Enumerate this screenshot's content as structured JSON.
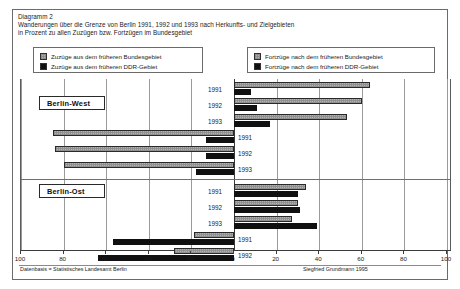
{
  "figure": {
    "label": "Diagramm 2",
    "title_line1": "Wanderungen über die Grenze von Berlin 1991, 1992 und 1993 nach Herkunfts- und Zielgebieten",
    "title_line2": "in Prozent zu allen Zuzügen bzw. Fortzügen im Bundesgebiet",
    "source_left": "Datenbasis = Statistisches Landesamt Berlin",
    "source_right": "Siegfried Grundmann 1995"
  },
  "legend": {
    "left_box": [
      {
        "swatch": "gray",
        "label": "Zuzüge aus dem früheren Bundesgebiet"
      },
      {
        "swatch": "black",
        "label": "Zuzüge aus dem früheren DDR-Gebiet"
      }
    ],
    "right_box": [
      {
        "swatch": "gray",
        "label": "Fortzüge nach dem früheren Bundesgebiet"
      },
      {
        "swatch": "black",
        "label": "Fortzüge nach dem früheren DDR-Gebiet"
      }
    ]
  },
  "groups": [
    {
      "id": "berlin-west",
      "label": "Berlin-West"
    },
    {
      "id": "berlin-ost",
      "label": "Berlin-Ost"
    }
  ],
  "chart_data": {
    "type": "bar",
    "orientation": "horizontal-diverging",
    "title": "Wanderungen über die Grenze von Berlin 1991, 1992 und 1993 nach Herkunfts- und Zielgebieten",
    "subtitle": "in Prozent zu allen Zuzügen bzw. Fortzügen im Bundesgebiet",
    "xlabel": "",
    "ylabel": "",
    "xlim": [
      -100,
      100
    ],
    "xticks": [
      -100,
      -80,
      -60,
      -40,
      -20,
      0,
      20,
      40,
      60,
      80,
      100
    ],
    "xticklabels": [
      "100",
      "80",
      "60",
      "40",
      "20",
      "0",
      "20",
      "40",
      "60",
      "80",
      "100"
    ],
    "grid": true,
    "legend_position": "top",
    "categories": [
      "1991",
      "1992",
      "1993"
    ],
    "panels": [
      {
        "group": "Berlin-West",
        "side": "right",
        "kind": "Zuzüge",
        "series": [
          {
            "name": "Zuzüge aus dem früheren Bundesgebiet",
            "swatch": "gray",
            "values": [
              64,
              60,
              53
            ]
          },
          {
            "name": "Zuzüge aus dem früheren DDR-Gebiet",
            "swatch": "black",
            "values": [
              8,
              11,
              17
            ]
          }
        ]
      },
      {
        "group": "Berlin-West",
        "side": "left",
        "kind": "Fortzüge",
        "series": [
          {
            "name": "Fortzüge nach dem früheren Bundesgebiet",
            "swatch": "gray",
            "values": [
              85,
              84,
              80
            ]
          },
          {
            "name": "Fortzüge nach dem früheren DDR-Gebiet",
            "swatch": "black",
            "values": [
              13,
              13,
              18
            ]
          }
        ]
      },
      {
        "group": "Berlin-Ost",
        "side": "right",
        "kind": "Zuzüge",
        "series": [
          {
            "name": "Zuzüge aus dem früheren Bundesgebiet",
            "swatch": "gray",
            "values": [
              34,
              30,
              27
            ]
          },
          {
            "name": "Zuzüge aus dem früheren DDR-Gebiet",
            "swatch": "black",
            "values": [
              30,
              31,
              39
            ]
          }
        ]
      },
      {
        "group": "Berlin-Ost",
        "side": "left",
        "kind": "Fortzüge",
        "series": [
          {
            "name": "Fortzüge nach dem früheren Bundesgebiet",
            "swatch": "gray",
            "values": [
              19,
              28,
              27
            ]
          },
          {
            "name": "Fortzüge nach dem früheren DDR-Gebiet",
            "swatch": "black",
            "values": [
              57,
              64,
              62
            ]
          }
        ]
      }
    ],
    "colors": {
      "gray_series": "#b4b4b4",
      "black_series": "#101010",
      "axis": "#3a3a3a",
      "grid": "#9a9a9a",
      "frame": "#6b6b6b"
    }
  }
}
